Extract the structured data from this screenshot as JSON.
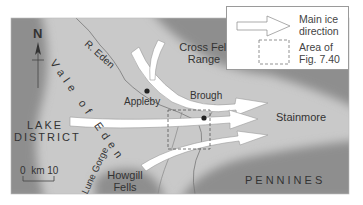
{
  "figure": {
    "type": "map",
    "colors": {
      "upland_dark": "#8e8e8e",
      "lowland_light": "#c9c9c9",
      "ice_arrow_fill": "#ffffff",
      "text": "#333333",
      "river": "#777777"
    }
  },
  "labels": {
    "north": "N",
    "vale_of_eden": "Vale of Eden",
    "river_eden": "R. Eden",
    "cross_fell": [
      "Cross Fell",
      "Range"
    ],
    "appleby": "Appleby",
    "brough": "Brough",
    "stainmore": "Stainmore",
    "lake_district": [
      "LAKE",
      "DISTRICT"
    ],
    "lune_gorge": "Lune Gorge",
    "howgill": [
      "Howgill",
      "Fells"
    ],
    "pennines": "PENNINES"
  },
  "scale_bar": {
    "start": "0",
    "unit": "km",
    "end": "10"
  },
  "legend": {
    "items": [
      {
        "symbol": "white-arrow",
        "label_line1": "Main ice",
        "label_line2": "direction"
      },
      {
        "symbol": "dashed-rectangle",
        "label_line1": "Area of",
        "label_line2": "Fig. 7.40"
      }
    ]
  }
}
